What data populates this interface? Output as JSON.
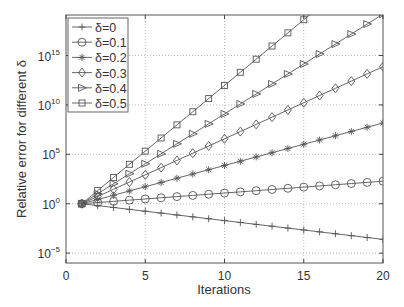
{
  "chart_data": {
    "type": "line",
    "title": "",
    "xlabel": "Iterations",
    "ylabel": "Relative error for different δ",
    "yscale": "log",
    "xlim": [
      0,
      20
    ],
    "ylim_log10": [
      -6.0,
      19.1
    ],
    "xticks": [
      0,
      5,
      10,
      15,
      20
    ],
    "yticks": [
      {
        "exp": -5,
        "label_base": "10",
        "label_exp": "−5"
      },
      {
        "exp": 0,
        "label_base": "10",
        "label_exp": "0"
      },
      {
        "exp": 5,
        "label_base": "10",
        "label_exp": "5"
      },
      {
        "exp": 10,
        "label_base": "10",
        "label_exp": "10"
      },
      {
        "exp": 15,
        "label_base": "10",
        "label_exp": "15"
      }
    ],
    "grid": true,
    "legend_position": "upper left",
    "x": [
      1,
      2,
      3,
      4,
      5,
      6,
      7,
      8,
      9,
      10,
      11,
      12,
      13,
      14,
      15,
      16,
      17,
      18,
      19,
      20
    ],
    "series": [
      {
        "name": "δ=0",
        "marker": "plus",
        "log10_slope": -0.19
      },
      {
        "name": "δ=0.1",
        "marker": "circle",
        "log10_slope": 0.12
      },
      {
        "name": "δ=0.2",
        "marker": "asterisk",
        "log10_slope": 0.43
      },
      {
        "name": "δ=0.3",
        "marker": "diamond",
        "log10_slope": 0.73
      },
      {
        "name": "δ=0.4",
        "marker": "triangle-right",
        "log10_slope": 1.01
      },
      {
        "name": "δ=0.5",
        "marker": "square",
        "log10_slope": 1.33
      }
    ],
    "series_log10_values": {
      "δ=0": [
        0,
        -0.19,
        -0.38,
        -0.57,
        -0.76,
        -0.95,
        -1.14,
        -1.33,
        -1.52,
        -1.71,
        -1.9,
        -2.09,
        -2.28,
        -2.47,
        -2.66,
        -2.85,
        -3.04,
        -3.23,
        -3.42,
        -3.61
      ],
      "δ=0.1": [
        0,
        0.12,
        0.24,
        0.36,
        0.48,
        0.6,
        0.72,
        0.84,
        0.96,
        1.08,
        1.2,
        1.32,
        1.44,
        1.56,
        1.68,
        1.8,
        1.92,
        2.04,
        2.16,
        2.28
      ],
      "δ=0.2": [
        0,
        0.43,
        0.86,
        1.29,
        1.72,
        2.15,
        2.58,
        3.01,
        3.44,
        3.87,
        4.3,
        4.73,
        5.16,
        5.59,
        6.02,
        6.45,
        6.88,
        7.31,
        7.74,
        8.17
      ],
      "δ=0.3": [
        0,
        0.73,
        1.46,
        2.19,
        2.92,
        3.65,
        4.38,
        5.11,
        5.84,
        6.57,
        7.3,
        8.03,
        8.76,
        9.49,
        10.22,
        10.95,
        11.68,
        12.41,
        13.14,
        13.87
      ],
      "δ=0.4": [
        0,
        1.01,
        2.02,
        3.03,
        4.04,
        5.05,
        6.06,
        7.07,
        8.08,
        9.09,
        10.1,
        11.11,
        12.12,
        13.13,
        14.14,
        15.15,
        16.16,
        17.17,
        18.18,
        19.19
      ],
      "δ=0.5": [
        0,
        1.33,
        2.66,
        3.99,
        5.32,
        6.65,
        7.98,
        9.31,
        10.64,
        11.97,
        13.3,
        14.63,
        15.96,
        17.29,
        18.62,
        19.95,
        21.28,
        22.61,
        23.94,
        25.27
      ]
    },
    "colors": {
      "line": "#555555",
      "axis": "#444444",
      "grid": "#bbbbbb",
      "background": "#ffffff"
    }
  }
}
